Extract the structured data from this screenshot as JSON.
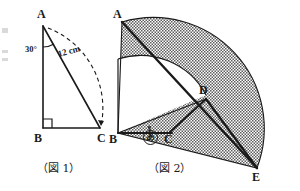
{
  "page": {
    "width": 300,
    "height": 191,
    "background": "#ffffff",
    "ink_color": "#1a1a1a",
    "hatch_color": "#6e6e6e"
  },
  "figure1": {
    "caption": "（図 1）",
    "vertices": [
      {
        "name": "A",
        "label": "A",
        "x": 43,
        "y": 22
      },
      {
        "name": "B",
        "label": "B",
        "x": 43,
        "y": 128
      },
      {
        "name": "C",
        "label": "C",
        "x": 103,
        "y": 128
      }
    ],
    "angle_at_A": "30°",
    "hypotenuse_length": "12 cm",
    "right_angle_vertex": "B",
    "arc_style": "dashed"
  },
  "figure2": {
    "caption": "（図 2）",
    "vertices": [
      {
        "name": "A",
        "label": "A",
        "x": 122,
        "y": 22
      },
      {
        "name": "B",
        "label": "B",
        "x": 118,
        "y": 133
      },
      {
        "name": "C",
        "label": "C",
        "x": 169,
        "y": 133
      },
      {
        "name": "D",
        "label": "D",
        "x": 206,
        "y": 95
      },
      {
        "name": "E",
        "label": "E",
        "x": 257,
        "y": 168
      }
    ],
    "marked_angle": {
      "symbol": "あ",
      "description": "circled-kana-a",
      "at_vertex": "C"
    },
    "shaded_region": "sector-hatched",
    "inner_arc": "B-to-D"
  }
}
